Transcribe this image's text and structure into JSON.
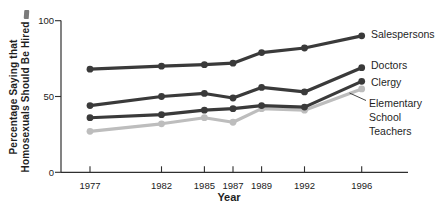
{
  "figure": {
    "ylabel_line1": "Percentage Saying that",
    "ylabel_line2": "Homosexuals Should Be Hired",
    "xlabel": "Year"
  },
  "chart_data": {
    "type": "line",
    "title": "",
    "xlabel": "Year",
    "ylabel": "Percentage Saying that Homosexuals Should Be Hired",
    "x": [
      1977,
      1982,
      1985,
      1987,
      1989,
      1992,
      1996
    ],
    "x_tick_labels": [
      "1977",
      "1982",
      "1985",
      "1987",
      "1989",
      "1992",
      "1996"
    ],
    "y_ticks": [
      0,
      50,
      100
    ],
    "ylim": [
      0,
      100
    ],
    "grid": false,
    "legend_position": "labels-at-right-line-ends",
    "marker": "filled-circle",
    "colors": {
      "dark_line": "#3a3a3a",
      "light_line": "#bdbdbd",
      "axis": "#2f2f2f",
      "text": "#1f1f1f"
    },
    "series": [
      {
        "name": "Salespersons",
        "color": "#3a3a3a",
        "values": [
          68,
          70,
          71,
          72,
          79,
          82,
          90
        ]
      },
      {
        "name": "Doctors",
        "color": "#3a3a3a",
        "values": [
          44,
          50,
          52,
          49,
          56,
          53,
          69
        ]
      },
      {
        "name": "Clergy",
        "color": "#3a3a3a",
        "values": [
          36,
          38,
          41,
          42,
          44,
          43,
          60
        ]
      },
      {
        "name": "Elementary School Teachers",
        "color": "#bdbdbd",
        "values": [
          27,
          32,
          36,
          33,
          42,
          41,
          55
        ]
      }
    ]
  }
}
